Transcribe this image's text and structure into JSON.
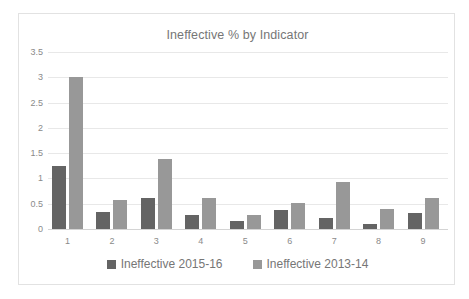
{
  "chart_data": {
    "type": "bar",
    "title": "Ineffective % by Indicator",
    "xlabel": "",
    "ylabel": "",
    "categories": [
      "1",
      "2",
      "3",
      "4",
      "5",
      "6",
      "7",
      "8",
      "9"
    ],
    "series": [
      {
        "name": "Ineffective 2015-16",
        "color": "#646464",
        "values": [
          1.25,
          0.34,
          0.62,
          0.28,
          0.16,
          0.37,
          0.22,
          0.1,
          0.31
        ]
      },
      {
        "name": "Ineffective 2013-14",
        "color": "#989898",
        "values": [
          3.0,
          0.57,
          1.38,
          0.61,
          0.27,
          0.51,
          0.92,
          0.39,
          0.62
        ]
      }
    ],
    "ylim": [
      0,
      3.5
    ],
    "yticks": [
      "0",
      "0.5",
      "1",
      "1.5",
      "2",
      "2.5",
      "3",
      "3.5"
    ],
    "ytick_values": [
      0,
      0.5,
      1,
      1.5,
      2,
      2.5,
      3,
      3.5
    ],
    "grid": true,
    "legend_position": "bottom"
  },
  "legend": [
    {
      "label": "Ineffective 2015-16",
      "color": "#646464",
      "swatch": "square-swatch"
    },
    {
      "label": "Ineffective 2013-14",
      "color": "#989898",
      "swatch": "square-swatch"
    }
  ]
}
